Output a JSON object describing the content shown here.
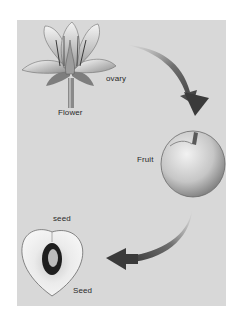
{
  "diagram": {
    "background_color": "#d8d8d8",
    "arrow_color": "#3a3a3a",
    "stages": [
      {
        "id": "flower",
        "label": "Flower",
        "callout": "ovary"
      },
      {
        "id": "fruit",
        "label": "Fruit"
      },
      {
        "id": "seed",
        "label": "Seed",
        "callout": "seed"
      }
    ],
    "arrows": [
      {
        "from": "flower",
        "to": "fruit"
      },
      {
        "from": "fruit",
        "to": "seed"
      }
    ]
  }
}
